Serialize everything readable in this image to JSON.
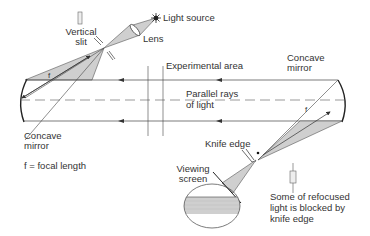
{
  "diagram": {
    "labels": {
      "light_source": "Light source",
      "lens": "Lens",
      "vertical_slit_line1": "Vertical",
      "vertical_slit_line2": "slit",
      "experimental_area": "Experimental area",
      "parallel_rays_line1": "Parallel rays",
      "parallel_rays_line2": "of light",
      "concave_mirror_left_line1": "Concave",
      "concave_mirror_left_line2": "mirror",
      "concave_mirror_right_line1": "Concave",
      "concave_mirror_right_line2": "mirror",
      "focal_length_legend": "f = focal length",
      "f_left": "f",
      "f_right": "f",
      "knife_edge": "Knife edge",
      "viewing_screen_line1": "Viewing",
      "viewing_screen_line2": "screen",
      "note_line1": "Some of refocused",
      "note_line2": "light is blocked by",
      "note_line3": "knife edge"
    },
    "colors": {
      "line": "#333333",
      "beam_fill": "#cfcfcf",
      "text": "#333333",
      "background": "#ffffff"
    }
  }
}
